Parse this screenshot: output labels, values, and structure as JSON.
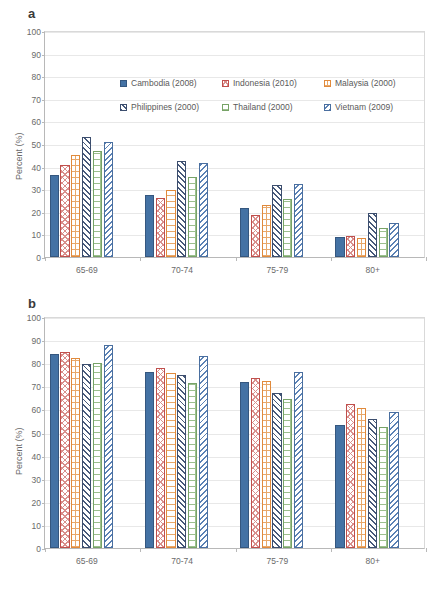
{
  "figure": {
    "panels": [
      {
        "id": "a",
        "label": "a"
      },
      {
        "id": "b",
        "label": "b"
      }
    ]
  },
  "axis": {
    "ylabel": "Percent (%)",
    "yticks": [
      "0",
      "10",
      "20",
      "30",
      "40",
      "50",
      "60",
      "70",
      "80",
      "90",
      "100"
    ],
    "categories": [
      "65-69",
      "70-74",
      "75-79",
      "80+"
    ]
  },
  "legend": {
    "entries": [
      {
        "label": "Cambodia (2008)",
        "pattern": "solid-blue",
        "color": "#4472a4"
      },
      {
        "label": "Indonesia (2010)",
        "pattern": "cross-hatch-red",
        "color": "#c0504d"
      },
      {
        "label": "Malaysia (2000)",
        "pattern": "ladder-orange",
        "color": "#e08a3c"
      },
      {
        "label": "Philippines (2000)",
        "pattern": "diagonal-navy",
        "color": "#3c4e6e"
      },
      {
        "label": "Thailand (2000)",
        "pattern": "brick-green",
        "color": "#77a367"
      },
      {
        "label": "Vietnam (2009)",
        "pattern": "diagonal-blue",
        "color": "#4a6fa0"
      }
    ]
  },
  "chart_data": [
    {
      "type": "bar",
      "panel": "a",
      "title": "a",
      "xlabel": "",
      "ylabel": "Percent (%)",
      "ylim": [
        0,
        100
      ],
      "ytick_step": 10,
      "grid": true,
      "legend_position": "inside-top",
      "categories": [
        "65-69",
        "70-74",
        "75-79",
        "80+"
      ],
      "series": [
        {
          "name": "Cambodia (2008)",
          "values": [
            36.2,
            27.3,
            21.9,
            9.0
          ]
        },
        {
          "name": "Indonesia (2010)",
          "values": [
            40.5,
            26.2,
            18.7,
            9.5
          ]
        },
        {
          "name": "Malaysia (2000)",
          "values": [
            45.1,
            29.8,
            22.8,
            8.4
          ]
        },
        {
          "name": "Philippines (2000)",
          "values": [
            53.0,
            42.4,
            31.8,
            19.5
          ]
        },
        {
          "name": "Thailand (2000)",
          "values": [
            46.7,
            35.4,
            25.6,
            13.0
          ]
        },
        {
          "name": "Vietnam (2009)",
          "values": [
            50.9,
            41.5,
            32.2,
            14.9
          ]
        }
      ]
    },
    {
      "type": "bar",
      "panel": "b",
      "title": "b",
      "xlabel": "",
      "ylabel": "Percent (%)",
      "ylim": [
        0,
        100
      ],
      "ytick_step": 10,
      "grid": true,
      "legend_position": "inside-top-right",
      "categories": [
        "65-69",
        "70-74",
        "75-79",
        "80+"
      ],
      "series": [
        {
          "name": "Cambodia (2008)",
          "values": [
            84.2,
            76.4,
            72.0,
            53.4
          ]
        },
        {
          "name": "Indonesia (2010)",
          "values": [
            85.0,
            78.0,
            73.4,
            62.5
          ]
        },
        {
          "name": "Malaysia (2000)",
          "values": [
            82.3,
            75.6,
            72.3,
            60.4
          ]
        },
        {
          "name": "Philippines (2000)",
          "values": [
            79.6,
            74.8,
            67.1,
            56.0
          ]
        },
        {
          "name": "Thailand (2000)",
          "values": [
            80.0,
            71.6,
            64.4,
            52.3
          ]
        },
        {
          "name": "Vietnam (2009)",
          "values": [
            87.7,
            83.3,
            76.1,
            59.0
          ]
        }
      ]
    }
  ]
}
